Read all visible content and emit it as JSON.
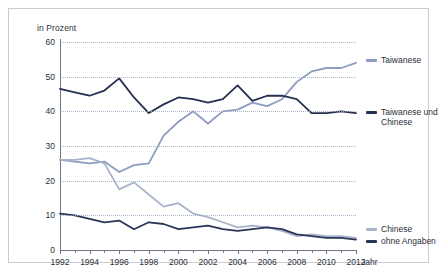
{
  "chart_data": {
    "type": "line",
    "title": "",
    "subtitle": "",
    "ylabel": "in Prozent",
    "xlabel": "Jahr",
    "ylim": [
      0,
      60
    ],
    "yticks": [
      0,
      10,
      20,
      30,
      40,
      50,
      60
    ],
    "xlim": [
      1992,
      2012
    ],
    "xticks_major": [
      1992,
      1994,
      1996,
      1998,
      2000,
      2002,
      2004,
      2006,
      2008,
      2010,
      2012
    ],
    "x": [
      1992,
      1993,
      1994,
      1995,
      1996,
      1997,
      1998,
      1999,
      2000,
      2001,
      2002,
      2003,
      2004,
      2005,
      2006,
      2007,
      2008,
      2009,
      2010,
      2011,
      2012
    ],
    "grid": true,
    "legend_position": "right",
    "series": [
      {
        "name": "Taiwanese",
        "color": "#8c9dc0",
        "values": [
          26.0,
          25.5,
          25.0,
          25.5,
          22.5,
          24.5,
          25.0,
          33.0,
          37.0,
          40.0,
          36.5,
          40.0,
          40.5,
          42.5,
          41.5,
          43.5,
          48.5,
          51.5,
          52.5,
          52.5,
          54.0
        ]
      },
      {
        "name": "Taiwanese und Chinese",
        "color": "#25304f",
        "values": [
          46.5,
          45.5,
          44.5,
          46.0,
          49.5,
          44.0,
          39.5,
          42.0,
          44.0,
          43.5,
          42.5,
          43.5,
          47.5,
          43.0,
          44.5,
          44.5,
          43.5,
          39.5,
          39.5,
          40.0,
          39.5
        ]
      },
      {
        "name": "Chinese",
        "color": "#a8b4cc",
        "values": [
          26.0,
          26.0,
          26.5,
          25.0,
          17.5,
          19.5,
          16.0,
          12.5,
          13.5,
          10.5,
          9.5,
          8.0,
          6.5,
          7.0,
          6.5,
          5.5,
          4.0,
          4.5,
          4.0,
          4.0,
          3.5
        ]
      },
      {
        "name": "ohne Angaben",
        "color": "#2b3557",
        "values": [
          10.5,
          10.0,
          9.0,
          8.0,
          8.5,
          6.0,
          8.0,
          7.5,
          6.0,
          6.5,
          7.0,
          6.0,
          5.5,
          6.0,
          6.5,
          6.0,
          4.5,
          4.0,
          3.5,
          3.5,
          3.0
        ]
      }
    ],
    "legend": [
      {
        "label": "Taiwanese",
        "color": "#8c9dc0"
      },
      {
        "label": "Taiwanese und\nChinese",
        "color": "#25304f"
      },
      {
        "label": "Chinese",
        "color": "#a8b4cc"
      },
      {
        "label": "ohne Angaben",
        "color": "#2b3557"
      }
    ]
  }
}
